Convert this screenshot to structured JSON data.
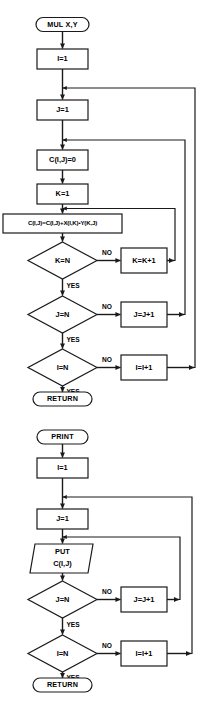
{
  "page": {
    "background_color": "#ffffff",
    "line_color": "#1a1a1a",
    "shape_fill": "#ffffff",
    "width": 200,
    "height": 727
  },
  "labels": {
    "yes": "YES",
    "no": "NO"
  },
  "flowcharts": [
    {
      "id": "mul",
      "name": "multiply-flowchart",
      "nodes": [
        {
          "id": "mul_start",
          "shape": "terminal",
          "text": "MUL  X,Y"
        },
        {
          "id": "mul_i1",
          "shape": "process",
          "text": "I=1"
        },
        {
          "id": "mul_j1",
          "shape": "process",
          "text": "J=1"
        },
        {
          "id": "mul_cij0",
          "shape": "process",
          "text": "C(I,J)=0"
        },
        {
          "id": "mul_k1",
          "shape": "process",
          "text": "K=1"
        },
        {
          "id": "mul_accum",
          "shape": "process",
          "text": "C(I,J)=C(I,J)+X(I,K)•Y(K,J)"
        },
        {
          "id": "mul_kn",
          "shape": "decision",
          "text": "K=N"
        },
        {
          "id": "mul_kinc",
          "shape": "process",
          "text": "K=K+1"
        },
        {
          "id": "mul_jn",
          "shape": "decision",
          "text": "J=N"
        },
        {
          "id": "mul_jinc",
          "shape": "process",
          "text": "J=J+1"
        },
        {
          "id": "mul_in",
          "shape": "decision",
          "text": "I=N"
        },
        {
          "id": "mul_iinc",
          "shape": "process",
          "text": "I=I+1"
        },
        {
          "id": "mul_return",
          "shape": "terminal",
          "text": "RETURN"
        }
      ],
      "edges": [
        {
          "from": "mul_start",
          "to": "mul_i1",
          "label": ""
        },
        {
          "from": "mul_i1",
          "to": "mul_j1",
          "label": ""
        },
        {
          "from": "mul_j1",
          "to": "mul_cij0",
          "label": ""
        },
        {
          "from": "mul_cij0",
          "to": "mul_k1",
          "label": ""
        },
        {
          "from": "mul_k1",
          "to": "mul_accum",
          "label": ""
        },
        {
          "from": "mul_accum",
          "to": "mul_kn",
          "label": ""
        },
        {
          "from": "mul_kn",
          "to": "mul_kinc",
          "label": "NO"
        },
        {
          "from": "mul_kinc",
          "to": "mul_accum",
          "label": ""
        },
        {
          "from": "mul_kn",
          "to": "mul_jn",
          "label": "YES"
        },
        {
          "from": "mul_jn",
          "to": "mul_jinc",
          "label": "NO"
        },
        {
          "from": "mul_jinc",
          "to": "mul_cij0",
          "label": ""
        },
        {
          "from": "mul_jn",
          "to": "mul_in",
          "label": "YES"
        },
        {
          "from": "mul_in",
          "to": "mul_iinc",
          "label": "NO"
        },
        {
          "from": "mul_iinc",
          "to": "mul_j1",
          "label": ""
        },
        {
          "from": "mul_in",
          "to": "mul_return",
          "label": "YES"
        }
      ]
    },
    {
      "id": "print",
      "name": "print-flowchart",
      "nodes": [
        {
          "id": "pr_start",
          "shape": "terminal",
          "text": "PRINT"
        },
        {
          "id": "pr_i1",
          "shape": "process",
          "text": "I=1"
        },
        {
          "id": "pr_j1",
          "shape": "process",
          "text": "J=1"
        },
        {
          "id": "pr_put",
          "shape": "input-output",
          "text": "PUT",
          "text2": "C(I,J)"
        },
        {
          "id": "pr_jn",
          "shape": "decision",
          "text": "J=N"
        },
        {
          "id": "pr_jinc",
          "shape": "process",
          "text": "J=J+1"
        },
        {
          "id": "pr_in",
          "shape": "decision",
          "text": "I=N"
        },
        {
          "id": "pr_iinc",
          "shape": "process",
          "text": "I=I+1"
        },
        {
          "id": "pr_return",
          "shape": "terminal",
          "text": "RETURN"
        }
      ],
      "edges": [
        {
          "from": "pr_start",
          "to": "pr_i1",
          "label": ""
        },
        {
          "from": "pr_i1",
          "to": "pr_j1",
          "label": ""
        },
        {
          "from": "pr_j1",
          "to": "pr_put",
          "label": ""
        },
        {
          "from": "pr_put",
          "to": "pr_jn",
          "label": ""
        },
        {
          "from": "pr_jn",
          "to": "pr_jinc",
          "label": "NO"
        },
        {
          "from": "pr_jinc",
          "to": "pr_put",
          "label": ""
        },
        {
          "from": "pr_jn",
          "to": "pr_in",
          "label": "YES"
        },
        {
          "from": "pr_in",
          "to": "pr_iinc",
          "label": "NO"
        },
        {
          "from": "pr_iinc",
          "to": "pr_j1",
          "label": ""
        },
        {
          "from": "pr_in",
          "to": "pr_return",
          "label": "YES"
        }
      ]
    }
  ]
}
